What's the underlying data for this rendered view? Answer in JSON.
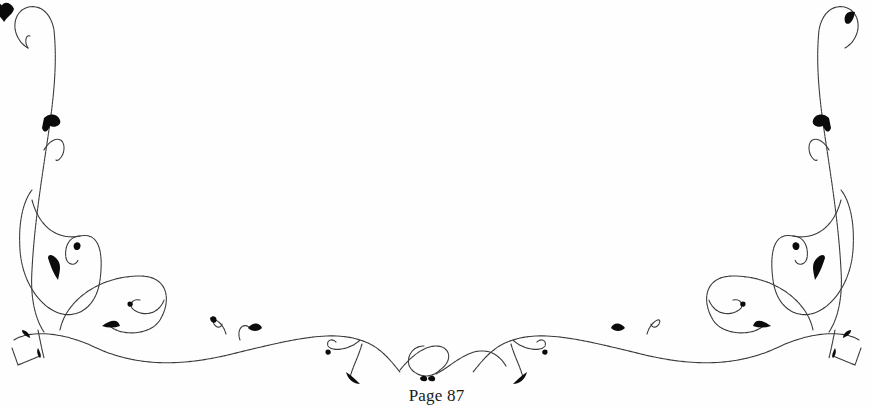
{
  "page": {
    "footer": {
      "page_number_label": "Page 87"
    },
    "ornament": {
      "type": "flourish-border",
      "icons": [
        "vine-flourish-icon",
        "heart-leaf-icon"
      ],
      "stroke_color": "#3a3a3a",
      "leaf_color": "#0b0b0b"
    },
    "background_color": "#fefefe"
  }
}
